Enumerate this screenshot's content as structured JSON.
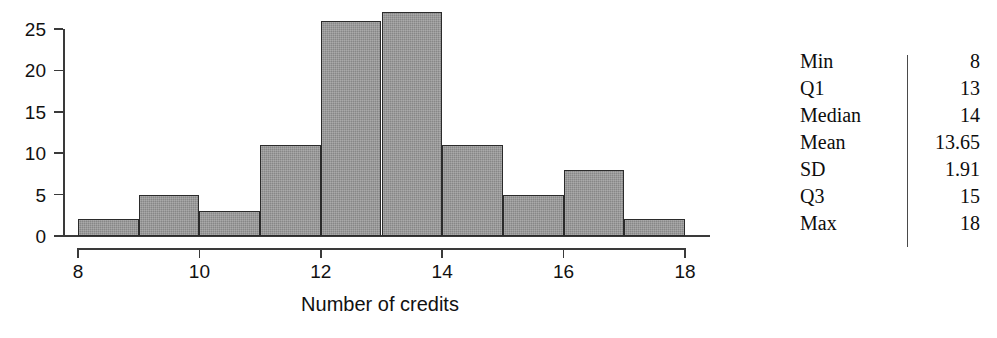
{
  "chart_data": {
    "type": "bar",
    "title": "",
    "subtitle": "",
    "xlabel": "Number of credits",
    "ylabel": "",
    "xlim": [
      8,
      18
    ],
    "ylim": [
      0,
      25
    ],
    "grid": false,
    "legend": "none",
    "bin_width": 1,
    "x_ticks": [
      "8",
      "10",
      "12",
      "14",
      "16",
      "18"
    ],
    "x_tick_values": [
      8,
      10,
      12,
      14,
      16,
      18
    ],
    "y_ticks": [
      "0",
      "5",
      "10",
      "15",
      "20",
      "25"
    ],
    "y_tick_values": [
      0,
      5,
      10,
      15,
      20,
      25
    ],
    "categories": [
      "8-9",
      "9-10",
      "10-11",
      "11-12",
      "12-13",
      "13-14",
      "14-15",
      "15-16",
      "16-17",
      "17-18"
    ],
    "bin_edges": [
      8,
      9,
      10,
      11,
      12,
      13,
      14,
      15,
      16,
      17,
      18
    ],
    "values": [
      2,
      5,
      3,
      11,
      26,
      27,
      11,
      5,
      8,
      2
    ],
    "bar_fill_color": "#878787",
    "bar_edge_color": "#2b2b2b",
    "axis_color": "#3a3a3a"
  },
  "stats": {
    "rows": [
      {
        "label": "Min",
        "value": "8"
      },
      {
        "label": "Q1",
        "value": "13"
      },
      {
        "label": "Median",
        "value": "14"
      },
      {
        "label": "Mean",
        "value": "13.65"
      },
      {
        "label": "SD",
        "value": "1.91"
      },
      {
        "label": "Q3",
        "value": "15"
      },
      {
        "label": "Max",
        "value": "18"
      }
    ]
  }
}
